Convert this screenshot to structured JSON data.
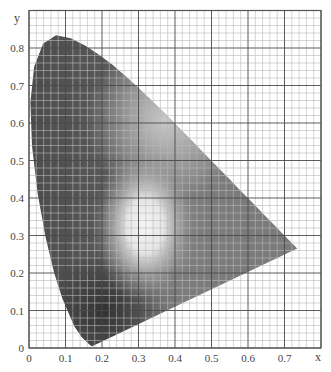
{
  "chart_data": {
    "type": "scatter",
    "title": "",
    "subtitle": "CIE 1931 xy chromaticity diagram (grayscale)",
    "xlabel": "x",
    "ylabel": "y",
    "xlim": [
      0,
      0.8
    ],
    "ylim": [
      0,
      0.9
    ],
    "grid": true,
    "grid_major_step": 0.1,
    "grid_minor_step": 0.02,
    "x_ticks": [
      "0",
      "0.1",
      "0.2",
      "0.3",
      "0.4",
      "0.5",
      "0.6",
      "0.7"
    ],
    "y_ticks": [
      "0",
      "0.1",
      "0.2",
      "0.3",
      "0.4",
      "0.5",
      "0.6",
      "0.7",
      "0.8"
    ],
    "series": [
      {
        "name": "spectral locus",
        "x": [
          0.1741,
          0.1738,
          0.1733,
          0.1726,
          0.1714,
          0.1689,
          0.1644,
          0.1566,
          0.144,
          0.1241,
          0.0913,
          0.0687,
          0.0454,
          0.0235,
          0.0082,
          0.0039,
          0.0139,
          0.0389,
          0.0743,
          0.1142,
          0.1547,
          0.1929,
          0.2296,
          0.2658,
          0.3016,
          0.3373,
          0.3731,
          0.4087,
          0.4441,
          0.4788,
          0.5125,
          0.5448,
          0.5752,
          0.6029,
          0.627,
          0.6482,
          0.6658,
          0.6801,
          0.6915,
          0.7006,
          0.7079,
          0.7347
        ],
        "y": [
          0.005,
          0.0049,
          0.0048,
          0.0048,
          0.0051,
          0.0069,
          0.0109,
          0.0177,
          0.0297,
          0.0578,
          0.1327,
          0.2007,
          0.295,
          0.4127,
          0.5384,
          0.6548,
          0.7502,
          0.812,
          0.8338,
          0.8262,
          0.8059,
          0.7816,
          0.7543,
          0.7243,
          0.6923,
          0.6589,
          0.6245,
          0.5896,
          0.5547,
          0.5202,
          0.4866,
          0.4544,
          0.4242,
          0.3965,
          0.3725,
          0.3514,
          0.334,
          0.3197,
          0.3083,
          0.2993,
          0.292,
          0.2653
        ]
      },
      {
        "name": "white point (brightest region)",
        "x": [
          0.3127
        ],
        "y": [
          0.329
        ]
      }
    ]
  },
  "axes": {
    "x_label": "x",
    "y_label": "y",
    "x_ticks": [
      "0",
      "0.1",
      "0.2",
      "0.3",
      "0.4",
      "0.5",
      "0.6",
      "0.7"
    ],
    "y_ticks": [
      "0",
      "0.1",
      "0.2",
      "0.3",
      "0.4",
      "0.5",
      "0.6",
      "0.7",
      "0.8"
    ]
  },
  "colors": {
    "background": "#ffffff",
    "grid_major": "#4a4a4a",
    "grid_minor": "#b8b8b8",
    "frame": "#555555",
    "locus_dark": "#4a4a4a",
    "locus_light": "#f4f4f4"
  }
}
